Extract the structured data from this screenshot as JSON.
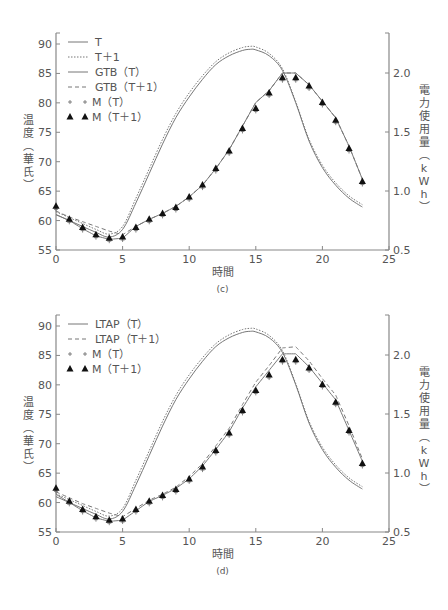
{
  "chart_data": [
    {
      "panel": "(c)",
      "type": "line",
      "caption": "(c)",
      "xlabel": "時間",
      "ylabel_left": "温度（華氏）",
      "ylabel_right": "電力使用量（kWh）",
      "xlim": [
        0,
        25
      ],
      "ylim_left": [
        55,
        90
      ],
      "ylim_right": [
        0.5,
        2.0
      ],
      "xticks": [
        "0",
        "5",
        "10",
        "15",
        "20",
        "25"
      ],
      "yticks_left": [
        "55",
        "60",
        "65",
        "70",
        "75",
        "80",
        "85",
        "90"
      ],
      "yticks_right": [
        "0.5",
        "1.0",
        "1.5",
        "2.0"
      ],
      "grid": false,
      "legend_position": "upper left",
      "legend": [
        {
          "label": "T",
          "style": "solid"
        },
        {
          "label": "T＋1",
          "style": "dotted"
        },
        {
          "label": "GTB（T）",
          "style": "solid"
        },
        {
          "label": "GTB（T＋1）",
          "style": "dashed"
        },
        {
          "label": "M（T）",
          "style": "plus-marker"
        },
        {
          "label": "M（T＋1）",
          "style": "triangle-marker"
        }
      ],
      "series": [
        {
          "name": "T",
          "axis": "left",
          "style": "solid",
          "x": [
            0,
            1,
            2,
            3,
            4,
            5,
            6,
            7,
            8,
            9,
            10,
            11,
            12,
            13,
            14,
            14.6,
            15,
            16,
            17,
            18,
            19,
            20,
            21,
            22,
            23
          ],
          "y": [
            61.0,
            60.0,
            59.0,
            58.0,
            57.2,
            58.5,
            63.0,
            68.0,
            73.0,
            77.5,
            81.0,
            84.0,
            86.5,
            88.0,
            88.9,
            89.1,
            89.0,
            88.0,
            85.5,
            80.0,
            73.5,
            69.0,
            66.0,
            63.8,
            62.3
          ]
        },
        {
          "name": "T＋1",
          "axis": "left",
          "style": "dotted",
          "x": [
            0,
            1,
            2,
            3,
            4,
            5,
            6,
            7,
            8,
            9,
            10,
            11,
            12,
            13,
            14,
            14.6,
            15,
            16,
            17,
            18,
            19,
            20,
            21,
            22,
            23
          ],
          "y": [
            61.5,
            60.5,
            59.5,
            58.5,
            57.7,
            59.0,
            63.8,
            68.8,
            73.8,
            78.2,
            81.7,
            84.6,
            87.0,
            88.5,
            89.4,
            89.6,
            89.5,
            88.4,
            85.8,
            80.2,
            73.8,
            69.4,
            66.4,
            64.2,
            62.7
          ]
        },
        {
          "name": "GTB（T）",
          "axis": "right",
          "style": "solid",
          "x": [
            0,
            1,
            2,
            3,
            4,
            5,
            6,
            7,
            8,
            9,
            10,
            11,
            12,
            13,
            14,
            15,
            16,
            17,
            18,
            19,
            20,
            21,
            22,
            23
          ],
          "y": [
            0.8,
            0.75,
            0.68,
            0.62,
            0.59,
            0.6,
            0.7,
            0.76,
            0.81,
            0.87,
            0.95,
            1.05,
            1.19,
            1.35,
            1.55,
            1.75,
            1.85,
            2.0,
            2.0,
            1.9,
            1.76,
            1.62,
            1.38,
            1.1
          ]
        },
        {
          "name": "GTB（T＋1）",
          "axis": "right",
          "style": "dashed",
          "x": [
            0,
            1,
            2,
            3,
            4,
            5,
            6,
            7,
            8,
            9,
            10,
            11,
            12,
            13,
            14,
            15,
            16,
            17,
            18,
            19,
            20,
            21,
            22,
            23
          ],
          "y": [
            0.83,
            0.78,
            0.74,
            0.7,
            0.66,
            0.63,
            0.7,
            0.76,
            0.81,
            0.87,
            0.95,
            1.05,
            1.19,
            1.35,
            1.55,
            1.75,
            1.85,
            2.0,
            2.0,
            1.9,
            1.76,
            1.62,
            1.38,
            1.1
          ]
        },
        {
          "name": "M（T）",
          "axis": "right",
          "style": "plus",
          "x": [
            0,
            1,
            2,
            3,
            4,
            5,
            6,
            7,
            8,
            9,
            10,
            11,
            12,
            13,
            14,
            15,
            16,
            17,
            18,
            19,
            20,
            21,
            22,
            23
          ],
          "y": [
            0.87,
            0.76,
            0.69,
            0.63,
            0.6,
            0.61,
            0.69,
            0.76,
            0.81,
            0.86,
            0.95,
            1.05,
            1.19,
            1.34,
            1.53,
            1.7,
            1.83,
            1.96,
            1.96,
            1.89,
            1.75,
            1.6,
            1.36,
            1.08
          ]
        },
        {
          "name": "M（T＋1）",
          "axis": "right",
          "style": "triangle",
          "x": [
            0,
            1,
            2,
            3,
            4,
            5,
            6,
            7,
            8,
            9,
            10,
            11,
            12,
            13,
            14,
            15,
            16,
            17,
            18,
            19,
            20,
            21,
            22,
            23
          ],
          "y": [
            0.87,
            0.76,
            0.69,
            0.63,
            0.6,
            0.61,
            0.69,
            0.76,
            0.81,
            0.86,
            0.95,
            1.05,
            1.19,
            1.34,
            1.53,
            1.7,
            1.83,
            1.96,
            1.96,
            1.89,
            1.75,
            1.6,
            1.36,
            1.08
          ]
        }
      ]
    },
    {
      "panel": "(d)",
      "type": "line",
      "caption": "(d)",
      "xlabel": "時間",
      "ylabel_left": "温度（華氏）",
      "ylabel_right": "電力使用量（kWh）",
      "xlim": [
        0,
        25
      ],
      "ylim_left": [
        55,
        90
      ],
      "ylim_right": [
        0.5,
        2.0
      ],
      "xticks": [
        "0",
        "5",
        "10",
        "15",
        "20",
        "25"
      ],
      "yticks_left": [
        "55",
        "60",
        "65",
        "70",
        "75",
        "80",
        "85",
        "90"
      ],
      "yticks_right": [
        "0.5",
        "1.0",
        "1.5",
        "2.0"
      ],
      "grid": false,
      "legend_position": "upper left",
      "legend": [
        {
          "label": "LTAP（T）",
          "style": "solid"
        },
        {
          "label": "LTAP（T＋1）",
          "style": "dashed"
        },
        {
          "label": "M（T）",
          "style": "plus-marker"
        },
        {
          "label": "M（T＋1）",
          "style": "triangle-marker"
        }
      ],
      "series": [
        {
          "name": "T (temperature)",
          "axis": "left",
          "style": "solid",
          "x": [
            0,
            1,
            2,
            3,
            4,
            5,
            6,
            7,
            8,
            9,
            10,
            11,
            12,
            13,
            14,
            14.6,
            15,
            16,
            17,
            18,
            19,
            20,
            21,
            22,
            23
          ],
          "y": [
            61.0,
            60.0,
            59.0,
            58.0,
            57.2,
            58.5,
            63.0,
            68.0,
            73.0,
            77.5,
            81.0,
            84.0,
            86.5,
            88.0,
            88.9,
            89.1,
            89.0,
            88.0,
            85.5,
            80.0,
            73.5,
            69.0,
            66.0,
            63.8,
            62.3
          ]
        },
        {
          "name": "T＋1 (temperature)",
          "axis": "left",
          "style": "dotted",
          "x": [
            0,
            1,
            2,
            3,
            4,
            5,
            6,
            7,
            8,
            9,
            10,
            11,
            12,
            13,
            14,
            14.6,
            15,
            16,
            17,
            18,
            19,
            20,
            21,
            22,
            23
          ],
          "y": [
            61.5,
            60.5,
            59.5,
            58.5,
            57.7,
            59.0,
            63.8,
            68.8,
            73.8,
            78.2,
            81.7,
            84.6,
            87.0,
            88.5,
            89.4,
            89.6,
            89.5,
            88.4,
            85.8,
            80.2,
            73.8,
            69.4,
            66.4,
            64.2,
            62.7
          ]
        },
        {
          "name": "LTAP（T）",
          "axis": "right",
          "style": "solid",
          "x": [
            0,
            1,
            2,
            3,
            4,
            5,
            6,
            7,
            8,
            9,
            10,
            11,
            12,
            13,
            14,
            15,
            16,
            17,
            18,
            19,
            20,
            21,
            22,
            23
          ],
          "y": [
            0.82,
            0.75,
            0.68,
            0.62,
            0.59,
            0.6,
            0.68,
            0.76,
            0.81,
            0.87,
            0.95,
            1.06,
            1.2,
            1.35,
            1.55,
            1.73,
            1.87,
            2.01,
            2.01,
            1.9,
            1.76,
            1.62,
            1.36,
            1.1
          ]
        },
        {
          "name": "LTAP（T＋1）",
          "axis": "right",
          "style": "dashed",
          "x": [
            0,
            1,
            2,
            3,
            4,
            5,
            6,
            7,
            8,
            9,
            10,
            11,
            12,
            13,
            14,
            15,
            16,
            17,
            18,
            19,
            20,
            21,
            22,
            23
          ],
          "y": [
            0.84,
            0.79,
            0.74,
            0.7,
            0.66,
            0.63,
            0.7,
            0.77,
            0.82,
            0.88,
            0.97,
            1.08,
            1.23,
            1.38,
            1.58,
            1.77,
            1.91,
            2.06,
            2.07,
            1.95,
            1.8,
            1.66,
            1.4,
            1.12
          ]
        },
        {
          "name": "M（T）",
          "axis": "right",
          "style": "plus",
          "x": [
            0,
            1,
            2,
            3,
            4,
            5,
            6,
            7,
            8,
            9,
            10,
            11,
            12,
            13,
            14,
            15,
            16,
            17,
            18,
            19,
            20,
            21,
            22,
            23
          ],
          "y": [
            0.87,
            0.76,
            0.69,
            0.63,
            0.6,
            0.61,
            0.69,
            0.76,
            0.81,
            0.86,
            0.95,
            1.05,
            1.19,
            1.34,
            1.53,
            1.7,
            1.83,
            1.96,
            1.96,
            1.89,
            1.75,
            1.6,
            1.36,
            1.08
          ]
        },
        {
          "name": "M（T＋1）",
          "axis": "right",
          "style": "triangle",
          "x": [
            0,
            1,
            2,
            3,
            4,
            5,
            6,
            7,
            8,
            9,
            10,
            11,
            12,
            13,
            14,
            15,
            16,
            17,
            18,
            19,
            20,
            21,
            22,
            23
          ],
          "y": [
            0.87,
            0.76,
            0.69,
            0.63,
            0.6,
            0.61,
            0.69,
            0.76,
            0.81,
            0.86,
            0.95,
            1.05,
            1.19,
            1.34,
            1.53,
            1.7,
            1.83,
            1.96,
            1.96,
            1.89,
            1.75,
            1.6,
            1.36,
            1.08
          ]
        }
      ]
    }
  ],
  "panels": {
    "c": {
      "caption": "(c)",
      "xlabel": "時間",
      "ylabel_left_chars": [
        "温",
        "度",
        "︵",
        "華",
        "氏",
        "︶"
      ],
      "ylabel_right_chars": [
        "電",
        "力",
        "使",
        "用",
        "量",
        "︵",
        "k",
        "W",
        "h",
        "︶"
      ],
      "legend": [
        "T",
        "T＋1",
        "GTB（T）",
        "GTB（T＋1）",
        "＋ M（T）",
        "▲ M（T＋1）"
      ]
    },
    "d": {
      "caption": "(d)",
      "xlabel": "時間",
      "ylabel_left_chars": [
        "温",
        "度",
        "︵",
        "華",
        "氏",
        "︶"
      ],
      "ylabel_right_chars": [
        "電",
        "力",
        "使",
        "用",
        "量",
        "︵",
        "k",
        "W",
        "h",
        "︶"
      ],
      "legend": [
        "LTAP（T）",
        "LTAP（T＋1）",
        "＋ M（T）",
        "▲ M（T＋1）"
      ]
    }
  },
  "colors": {
    "line": "#777777",
    "axis": "#888888",
    "marker": "#111111",
    "text": "#555555",
    "background": "#ffffff"
  }
}
